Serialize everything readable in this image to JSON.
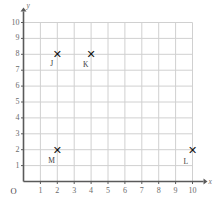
{
  "chart_data": {
    "type": "scatter",
    "title": "",
    "xlabel": "x",
    "ylabel": "y",
    "xlim": [
      0,
      10
    ],
    "ylim": [
      0,
      10
    ],
    "grid": true,
    "legend": "none",
    "origin_label": "O",
    "xticks": [
      "1",
      "2",
      "3",
      "4",
      "5",
      "6",
      "7",
      "8",
      "9",
      "10"
    ],
    "yticks": [
      "1",
      "2",
      "3",
      "4",
      "5",
      "6",
      "7",
      "8",
      "9",
      "10"
    ],
    "xtick_values": [
      1,
      2,
      3,
      4,
      5,
      6,
      7,
      8,
      9,
      10
    ],
    "ytick_values": [
      1,
      2,
      3,
      4,
      5,
      6,
      7,
      8,
      9,
      10
    ],
    "marker": "✕",
    "points": [
      {
        "label": "J",
        "x": 2,
        "y": 8,
        "label_dx": -7,
        "label_dy": 6
      },
      {
        "label": "K",
        "x": 4,
        "y": 8,
        "label_dx": -8,
        "label_dy": 7
      },
      {
        "label": "M",
        "x": 2,
        "y": 2,
        "label_dx": -9,
        "label_dy": 7
      },
      {
        "label": "L",
        "x": 10,
        "y": 2,
        "label_dx": -9,
        "label_dy": 8
      }
    ],
    "colors": {
      "grid": "#d0d0d0",
      "axis": "#5a5a5a",
      "marker": "#111111",
      "tick_text": "#6b6b6b",
      "background": "#ffffff"
    }
  }
}
